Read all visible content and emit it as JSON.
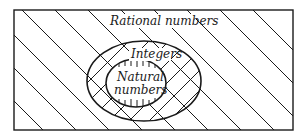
{
  "diagram": {
    "type": "venn-nested-sets",
    "sets": [
      {
        "id": "rational",
        "label": "Rational numbers",
        "shape": "rectangle",
        "hatch": "diagonal"
      },
      {
        "id": "integers",
        "label": "Integers",
        "shape": "ellipse",
        "hatch": "cross-diagonal"
      },
      {
        "id": "natural",
        "label_line1": "Natural",
        "label_line2": "numbers",
        "shape": "ellipse",
        "hatch": "vertical"
      }
    ],
    "colors": {
      "line": "#1a1a1a",
      "background": "#ffffff"
    }
  }
}
